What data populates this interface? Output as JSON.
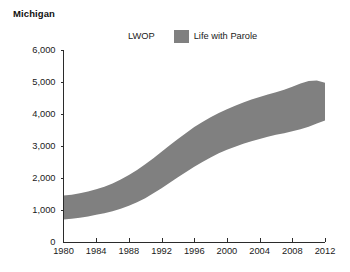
{
  "chart": {
    "title": "Michigan",
    "legend": [
      {
        "label": "LWOP",
        "color": "#ffffff",
        "swatch": "hidden"
      },
      {
        "label": "Life with Parole",
        "color": "#808080",
        "swatch": "filled"
      }
    ]
  },
  "chart_data": {
    "type": "area",
    "title": "Michigan",
    "xlabel": "",
    "ylabel": "",
    "xlim": [
      1980,
      2012
    ],
    "ylim": [
      0,
      6000
    ],
    "grid": false,
    "legend_position": "top",
    "xticks": [
      "1980",
      "1984",
      "1988",
      "1992",
      "1996",
      "2000",
      "2004",
      "2008",
      "2012"
    ],
    "xtick_values": [
      1980,
      1984,
      1988,
      1992,
      1996,
      2000,
      2004,
      2008,
      2012
    ],
    "yticks": [
      "0",
      "1,000",
      "2,000",
      "3,000",
      "4,000",
      "5,000",
      "6,000"
    ],
    "ytick_values": [
      0,
      1000,
      2000,
      3000,
      4000,
      5000,
      6000
    ],
    "x": [
      1980,
      1981,
      1982,
      1983,
      1984,
      1985,
      1986,
      1987,
      1988,
      1989,
      1990,
      1991,
      1992,
      1993,
      1994,
      1995,
      1996,
      1997,
      1998,
      1999,
      2000,
      2001,
      2002,
      2003,
      2004,
      2005,
      2006,
      2007,
      2008,
      2009,
      2010,
      2011,
      2012
    ],
    "series": [
      {
        "name": "LWOP",
        "color": "#ffffff",
        "stacked_lower_bound": true,
        "values": [
          700,
          730,
          760,
          800,
          850,
          900,
          960,
          1040,
          1130,
          1240,
          1370,
          1520,
          1680,
          1850,
          2020,
          2190,
          2350,
          2500,
          2640,
          2770,
          2880,
          2980,
          3070,
          3150,
          3220,
          3290,
          3350,
          3400,
          3460,
          3520,
          3600,
          3700,
          3800
        ]
      },
      {
        "name": "Life with Parole",
        "color": "#808080",
        "stacked_upper_bound": true,
        "values": [
          1450,
          1480,
          1520,
          1580,
          1650,
          1730,
          1830,
          1950,
          2090,
          2250,
          2430,
          2620,
          2820,
          3020,
          3220,
          3410,
          3590,
          3750,
          3900,
          4030,
          4150,
          4260,
          4360,
          4450,
          4530,
          4610,
          4680,
          4760,
          4850,
          4950,
          5030,
          5050,
          4980
        ]
      }
    ],
    "band": {
      "description": "Shaded gray band between the LWOP lower boundary and the Life with Parole upper boundary",
      "fill": "#808080"
    }
  }
}
